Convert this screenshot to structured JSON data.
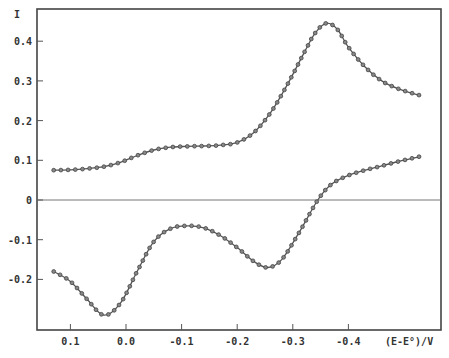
{
  "chart_data": {
    "type": "line",
    "title": "",
    "xlabel": "(E-E°)/V",
    "ylabel": "I",
    "xlim": [
      0.13,
      -0.55
    ],
    "ylim": [
      -0.32,
      0.48
    ],
    "x_reversed": true,
    "grid": false,
    "legend": null,
    "x_ticks": [
      0.1,
      0.0,
      -0.1,
      -0.2,
      -0.3,
      -0.4
    ],
    "x_tick_labels": [
      "0.1",
      "0.0",
      "-0.1",
      "-0.2",
      "-0.3",
      "-0.4"
    ],
    "y_ticks": [
      0.4,
      0.3,
      0.2,
      0.1,
      0,
      -0.1,
      -0.2
    ],
    "y_tick_labels": [
      "0.4",
      "0.3",
      "0.2",
      "0.1",
      "0",
      "-0.1",
      "-0.2"
    ],
    "zero_line": true,
    "series": [
      {
        "name": "forward scan",
        "marker": "circle",
        "x": [
          0.13,
          0.1,
          0.07,
          0.04,
          0.01,
          -0.02,
          -0.05,
          -0.08,
          -0.11,
          -0.14,
          -0.17,
          -0.2,
          -0.23,
          -0.26,
          -0.29,
          -0.32,
          -0.34,
          -0.36,
          -0.38,
          -0.4,
          -0.43,
          -0.46,
          -0.49,
          -0.53
        ],
        "values": [
          0.075,
          0.076,
          0.079,
          0.084,
          0.095,
          0.112,
          0.126,
          0.133,
          0.135,
          0.136,
          0.138,
          0.145,
          0.17,
          0.22,
          0.29,
          0.37,
          0.42,
          0.445,
          0.43,
          0.385,
          0.335,
          0.3,
          0.28,
          0.263
        ]
      },
      {
        "name": "reverse scan",
        "marker": "circle",
        "x": [
          0.13,
          0.1,
          0.07,
          0.04,
          0.01,
          -0.02,
          -0.05,
          -0.08,
          -0.11,
          -0.14,
          -0.17,
          -0.2,
          -0.23,
          -0.255,
          -0.28,
          -0.31,
          -0.345,
          -0.37,
          -0.4,
          -0.43,
          -0.46,
          -0.49,
          -0.53
        ],
        "values": [
          -0.18,
          -0.205,
          -0.25,
          -0.29,
          -0.26,
          -0.18,
          -0.105,
          -0.072,
          -0.065,
          -0.07,
          -0.09,
          -0.12,
          -0.155,
          -0.17,
          -0.15,
          -0.085,
          0.0,
          0.04,
          0.062,
          0.075,
          0.086,
          0.097,
          0.11
        ]
      }
    ]
  },
  "axes": {
    "y_label": "I",
    "x_label": "(E-E°)/V"
  }
}
